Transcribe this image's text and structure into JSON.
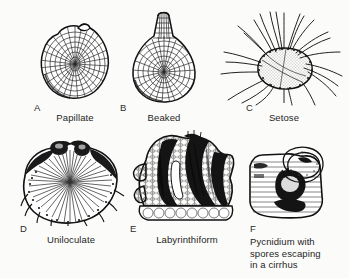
{
  "figure": {
    "background_color": "#fbfbfa",
    "ink_color": "#1a1a1a",
    "panels": [
      {
        "letter": "A",
        "label": "Papillate",
        "art_name": "papillate-pycnidium-illustration",
        "description": "rounded cellular pycnidium with small apical papilla"
      },
      {
        "letter": "B",
        "label": "Beaked",
        "art_name": "beaked-pycnidium-illustration",
        "description": "flask-shaped cellular pycnidium with elongate neck or beak"
      },
      {
        "letter": "C",
        "label": "Setose",
        "art_name": "setose-pycnidium-illustration",
        "description": "stippled pycnidium bearing numerous long curved setae"
      },
      {
        "letter": "D",
        "label": "Uniloculate",
        "art_name": "uniloculate-pycnidium-illustration",
        "description": "sectioned single-chambered pycnidium with radiating conidiophores"
      },
      {
        "letter": "E",
        "label": "Labyrinthiform",
        "art_name": "labyrinthiform-pycnidium-illustration",
        "description": "sectioned pycnidium with convoluted labyrinth-like dark cavities"
      },
      {
        "letter": "F",
        "label": "Pycnidium with\nspores escaping\nin a cirrhus",
        "art_name": "cirrhus-pycnidium-illustration",
        "description": "pycnidium in section with spore mass extruding as a coiled cirrhus"
      }
    ]
  }
}
